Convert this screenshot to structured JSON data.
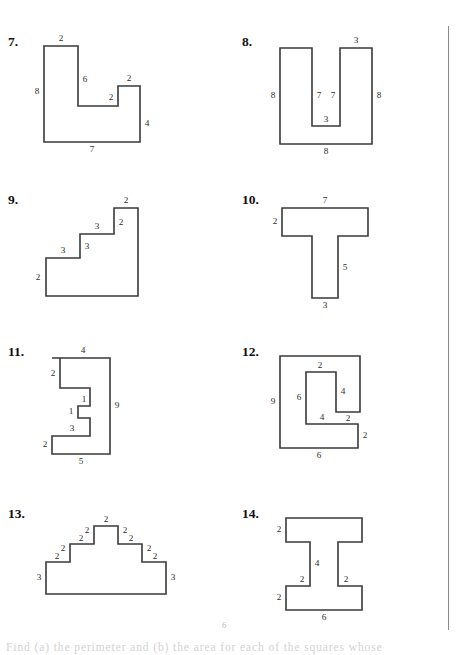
{
  "page": {
    "page_number": "6",
    "footer_text": "Find (a) the perimeter and (b) the area for each of the squares whose"
  },
  "problems": [
    {
      "number": "7.",
      "name": "problem-7",
      "shape_name": "l-shape-with-notch",
      "viewbox": "0 0 120 120",
      "points": "16,12 50,12 50,72 90,72 90,52 112,52 112,108 16,108",
      "labels": [
        {
          "text": "2",
          "x": 33,
          "y": 5
        },
        {
          "text": "8",
          "x": 9,
          "y": 58
        },
        {
          "text": "6",
          "x": 57,
          "y": 46
        },
        {
          "text": "2",
          "x": 83,
          "y": 64
        },
        {
          "text": "2",
          "x": 101,
          "y": 45
        },
        {
          "text": "4",
          "x": 119,
          "y": 90
        },
        {
          "text": "7",
          "x": 64,
          "y": 116
        }
      ]
    },
    {
      "number": "8.",
      "name": "problem-8",
      "shape_name": "u-shape",
      "viewbox": "0 0 120 120",
      "points": "18,14 50,14 50,92 78,92 78,14 110,14 110,110 18,110",
      "labels": [
        {
          "text": "3",
          "x": 94,
          "y": 7
        },
        {
          "text": "8",
          "x": 11,
          "y": 62
        },
        {
          "text": "7",
          "x": 57,
          "y": 62
        },
        {
          "text": "7",
          "x": 71,
          "y": 62
        },
        {
          "text": "8",
          "x": 117,
          "y": 62
        },
        {
          "text": "3",
          "x": 64,
          "y": 86
        },
        {
          "text": "8",
          "x": 64,
          "y": 118
        }
      ]
    },
    {
      "number": "9.",
      "name": "problem-9",
      "shape_name": "staircase-three-steps",
      "viewbox": "0 0 120 120",
      "points": "18,66 52,66 52,42 86,42 86,16 110,16 110,104 18,104",
      "labels": [
        {
          "text": "2",
          "x": 10,
          "y": 86
        },
        {
          "text": "3",
          "x": 35,
          "y": 59
        },
        {
          "text": "3",
          "x": 59,
          "y": 55
        },
        {
          "text": "3",
          "x": 69,
          "y": 35
        },
        {
          "text": "2",
          "x": 93,
          "y": 31
        },
        {
          "text": "2",
          "x": 98,
          "y": 9
        }
      ]
    },
    {
      "number": "10.",
      "name": "problem-10",
      "shape_name": "t-shape",
      "viewbox": "0 0 120 120",
      "points": "20,16 106,16 106,44 76,44 76,106 50,106 50,44 20,44",
      "labels": [
        {
          "text": "7",
          "x": 63,
          "y": 9
        },
        {
          "text": "2",
          "x": 13,
          "y": 30
        },
        {
          "text": "5",
          "x": 83,
          "y": 76
        },
        {
          "text": "3",
          "x": 63,
          "y": 114
        }
      ]
    },
    {
      "number": "11.",
      "name": "problem-11",
      "shape_name": "zigzag-e-shape",
      "viewbox": "0 0 120 120",
      "points": "24,14 82,14 82,110 24,110 24,92 62,92 62,74 50,74 50,62 62,62 62,44 32,44 32,14",
      "labels": [
        {
          "text": "4",
          "x": 55,
          "y": 7
        },
        {
          "text": "2",
          "x": 25,
          "y": 30
        },
        {
          "text": "1",
          "x": 56,
          "y": 56
        },
        {
          "text": "1",
          "x": 43,
          "y": 68
        },
        {
          "text": "9",
          "x": 89,
          "y": 62
        },
        {
          "text": "3",
          "x": 44,
          "y": 85
        },
        {
          "text": "2",
          "x": 17,
          "y": 101
        },
        {
          "text": "5",
          "x": 53,
          "y": 118
        }
      ]
    },
    {
      "number": "12.",
      "name": "problem-12",
      "shape_name": "c-shape-with-notch",
      "viewbox": "0 0 120 120",
      "points": "18,12 98,12 98,68 74,68 74,28 44,28 44,80 96,80 96,104 18,104",
      "labels": [
        {
          "text": "9",
          "x": 11,
          "y": 58
        },
        {
          "text": "6",
          "x": 37,
          "y": 54
        },
        {
          "text": "2",
          "x": 58,
          "y": 22
        },
        {
          "text": "4",
          "x": 81,
          "y": 48
        },
        {
          "text": "2",
          "x": 86,
          "y": 75
        },
        {
          "text": "4",
          "x": 60,
          "y": 74
        },
        {
          "text": "2",
          "x": 103,
          "y": 92
        },
        {
          "text": "6",
          "x": 57,
          "y": 112
        }
      ]
    },
    {
      "number": "13.",
      "name": "problem-13",
      "shape_name": "stepped-pyramid",
      "viewbox": "0 0 150 100",
      "points": "18,56 42,56 42,38 66,38 66,20 90,20 90,38 114,38 114,56 138,56 138,88 18,88",
      "labels": [
        {
          "text": "2",
          "x": 78,
          "y": 14
        },
        {
          "text": "2",
          "x": 59,
          "y": 25
        },
        {
          "text": "2",
          "x": 97,
          "y": 25
        },
        {
          "text": "2",
          "x": 53,
          "y": 33
        },
        {
          "text": "2",
          "x": 103,
          "y": 33
        },
        {
          "text": "2",
          "x": 35,
          "y": 43
        },
        {
          "text": "2",
          "x": 121,
          "y": 43
        },
        {
          "text": "2",
          "x": 29,
          "y": 51
        },
        {
          "text": "2",
          "x": 127,
          "y": 51
        },
        {
          "text": "3",
          "x": 11,
          "y": 72
        },
        {
          "text": "3",
          "x": 145,
          "y": 72
        }
      ]
    },
    {
      "number": "14.",
      "name": "problem-14",
      "shape_name": "i-beam-shape",
      "viewbox": "0 0 120 120",
      "points": "24,12 100,12 100,36 76,36 76,80 100,80 100,104 24,104 24,80 48,80 48,36 24,36",
      "labels": [
        {
          "text": "2",
          "x": 17,
          "y": 24
        },
        {
          "text": "4",
          "x": 55,
          "y": 58
        },
        {
          "text": "2",
          "x": 40,
          "y": 74
        },
        {
          "text": "2",
          "x": 84,
          "y": 74
        },
        {
          "text": "2",
          "x": 17,
          "y": 92
        },
        {
          "text": "6",
          "x": 62,
          "y": 112
        }
      ]
    }
  ],
  "layout": {
    "cells": [
      {
        "left": 0,
        "top": 34
      },
      {
        "left": 234,
        "top": 34
      },
      {
        "left": 0,
        "top": 192
      },
      {
        "left": 234,
        "top": 192
      },
      {
        "left": 0,
        "top": 344
      },
      {
        "left": 234,
        "top": 344
      },
      {
        "left": 0,
        "top": 506
      },
      {
        "left": 234,
        "top": 506
      }
    ]
  }
}
